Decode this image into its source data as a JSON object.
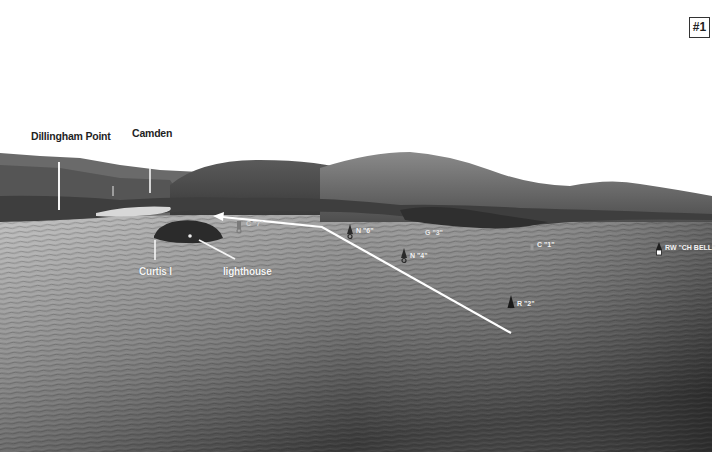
{
  "figure": {
    "badge": "#1",
    "place_labels": [
      {
        "id": "camden",
        "text": "Camden",
        "x": 132,
        "y": 127
      },
      {
        "id": "dillingham-point",
        "text": "Dillingham Point",
        "x": 31,
        "y": 130
      },
      {
        "id": "curtis-island",
        "text": "Curtis I",
        "x": 139,
        "y": 266
      },
      {
        "id": "lighthouse",
        "text": "lighthouse",
        "x": 223,
        "y": 266
      }
    ],
    "buoys": [
      {
        "id": "c7",
        "text": "C \"7\"",
        "type": "can",
        "x": 238,
        "y": 222
      },
      {
        "id": "n6",
        "text": "N \"6\"",
        "type": "nun",
        "x": 349,
        "y": 227
      },
      {
        "id": "g3",
        "text": "G \"3\"",
        "type": "can",
        "x": 421,
        "y": 229
      },
      {
        "id": "n4",
        "text": "N \"4\"",
        "type": "nun",
        "x": 404,
        "y": 252
      },
      {
        "id": "c1",
        "text": "C \"1\"",
        "type": "can",
        "x": 533,
        "y": 241
      },
      {
        "id": "rw-ch-bell",
        "text": "RW \"CH BELL\"",
        "type": "bell",
        "x": 658,
        "y": 244
      },
      {
        "id": "r2",
        "text": "R \"2\"",
        "type": "nun",
        "x": 511,
        "y": 300
      }
    ],
    "route": {
      "points": [
        [
          511,
          333
        ],
        [
          322,
          227
        ],
        [
          215,
          216
        ]
      ],
      "arrow_end": [
        215,
        216
      ],
      "color": "#ffffff"
    },
    "colors": {
      "sky": "#ffffff",
      "hills_dark": "#4a4a4a",
      "hills_mid": "#6e6e6e",
      "water_near": "#6a6a6a",
      "water_far": "#bdbdbd",
      "label_dark": "#1f1f1f",
      "label_light": "#f4f4f4"
    }
  }
}
